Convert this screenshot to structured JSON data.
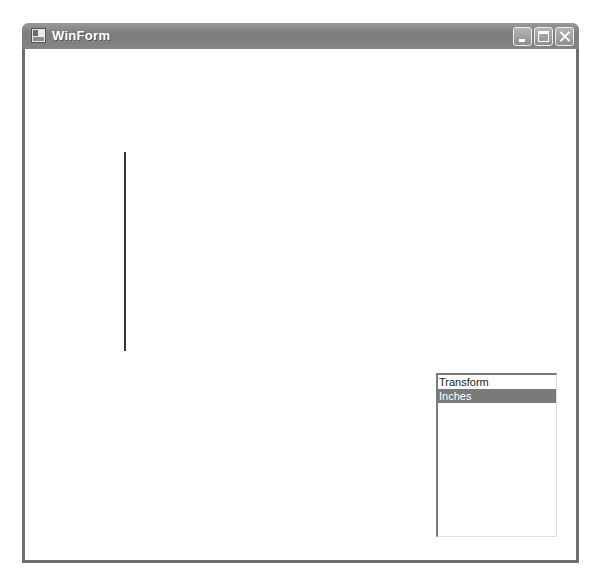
{
  "window": {
    "title": "WinForm",
    "icon": "app-window-icon",
    "controls": {
      "minimize": "minimize-icon",
      "maximize": "maximize-icon",
      "close": "close-icon"
    }
  },
  "canvas": {
    "shape": "vertical-line",
    "line_color": "#333333"
  },
  "listbox": {
    "items": [
      {
        "label": "Transform",
        "selected": false
      },
      {
        "label": "Inches",
        "selected": true
      }
    ],
    "selected_color": "#7a7a7a"
  }
}
